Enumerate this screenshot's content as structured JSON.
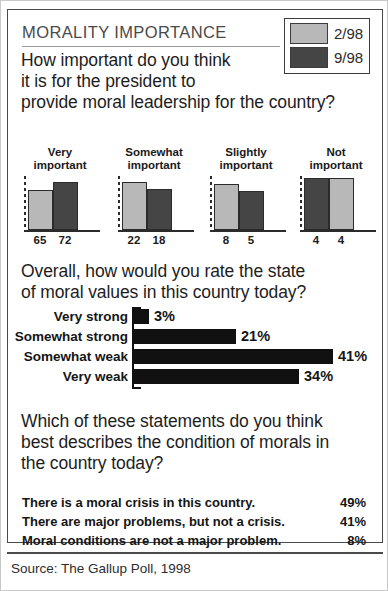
{
  "header": {
    "title": "MORALITY IMPORTANCE"
  },
  "legend": {
    "items": [
      {
        "label": "2/98",
        "color": "#b8b8b8",
        "icon": "legend-swatch-light"
      },
      {
        "label": "9/98",
        "color": "#454545",
        "icon": "legend-swatch-dark"
      }
    ]
  },
  "questions": {
    "q1_line1": "How important do you think",
    "q1_line2": "it is for the president to",
    "q1_line3": "provide moral leadership for the country?",
    "q2_line1": "Overall, how would you rate the state",
    "q2_line2": "of moral values in this country today?",
    "q3_line1": "Which of these statements do you think",
    "q3_line2": "best describes the condition of morals in",
    "q3_line3": "the country today?"
  },
  "statements": [
    {
      "text": "There is a moral crisis in this country.",
      "percent": "49%"
    },
    {
      "text": "There are major problems, but not a crisis.",
      "percent": "41%"
    },
    {
      "text": "Moral conditions are not a major problem.",
      "percent": "8%"
    }
  ],
  "source": "Source: The Gallup Poll, 1998",
  "colors": {
    "series_2_98": "#b8b8b8",
    "series_9_98": "#454545",
    "bar_black": "#111111",
    "ink": "#1a1a1a",
    "rule": "#4a4a4a"
  },
  "chart_data": [
    {
      "type": "bar",
      "title": "How important do you think it is for the president to provide moral leadership for the country?",
      "xlabel": "",
      "ylabel": "",
      "ylim": [
        0,
        80
      ],
      "grid": false,
      "legend_position": "top-right",
      "categories": [
        "Very important",
        "Somewhat important",
        "Slightly important",
        "Not important"
      ],
      "category_lines": [
        [
          "Very",
          "important"
        ],
        [
          "Somewhat",
          "important"
        ],
        [
          "Slightly",
          "important"
        ],
        [
          "Not",
          "important"
        ]
      ],
      "series": [
        {
          "name": "2/98",
          "color": "#b8b8b8",
          "values": [
            65,
            22,
            8,
            4
          ]
        },
        {
          "name": "9/98",
          "color": "#454545",
          "values": [
            72,
            18,
            5,
            4
          ]
        }
      ],
      "series_order_by_group": [
        [
          "2/98",
          "9/98"
        ],
        [
          "2/98",
          "9/98"
        ],
        [
          "2/98",
          "9/98"
        ],
        [
          "9/98",
          "2/98"
        ]
      ],
      "value_labels": [
        [
          "65",
          "72"
        ],
        [
          "22",
          "18"
        ],
        [
          "8",
          "5"
        ],
        [
          "4",
          "4"
        ]
      ],
      "bar_pixel_heights": [
        [
          40,
          48
        ],
        [
          48,
          41
        ],
        [
          46,
          39
        ],
        [
          52,
          52
        ]
      ],
      "note": "Bars are stylized; drawn heights do not scale linearly with values."
    },
    {
      "type": "bar",
      "orientation": "horizontal",
      "title": "Overall, how would you rate the state of moral values in this country today?",
      "xlabel": "",
      "ylabel": "",
      "xlim": [
        0,
        45
      ],
      "grid": false,
      "categories": [
        "Very strong",
        "Somewhat strong",
        "Somewhat weak",
        "Very weak"
      ],
      "values": [
        3,
        21,
        41,
        34
      ],
      "value_labels": [
        "3%",
        "21%",
        "41%",
        "34%"
      ],
      "bar_color": "#111111"
    },
    {
      "type": "table",
      "title": "Which of these statements do you think best describes the condition of morals in the country today?",
      "columns": [
        "Statement",
        "Percent"
      ],
      "rows": [
        [
          "There is a moral crisis in this country.",
          "49%"
        ],
        [
          "There are major problems, but not a crisis.",
          "41%"
        ],
        [
          "Moral conditions are not a major problem.",
          "8%"
        ]
      ]
    }
  ]
}
